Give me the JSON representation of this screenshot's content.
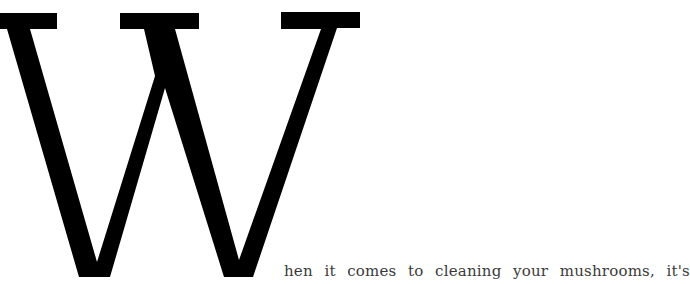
{
  "article": {
    "drop_cap": "W",
    "first_line_remainder": "hen it comes to cleaning your mushrooms, it's"
  },
  "colors": {
    "drop_cap": "#000000",
    "text": "#3a3a3a",
    "background": "#ffffff"
  }
}
